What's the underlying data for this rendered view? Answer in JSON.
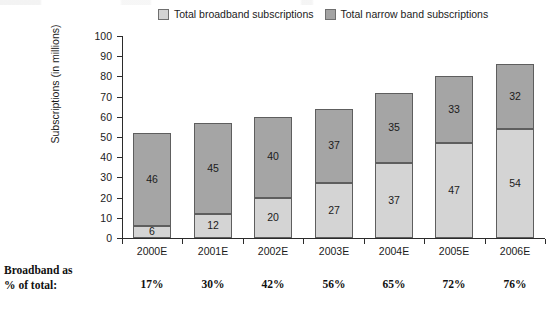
{
  "legend": {
    "entries": [
      {
        "label": "Total broadband subscriptions",
        "swatch_icon": "square-swatch-light",
        "color": "#d4d4d4"
      },
      {
        "label": "Total narrow band subscriptions",
        "swatch_icon": "square-swatch-dark",
        "color": "#a5a5a5"
      }
    ]
  },
  "footer": {
    "label": "Broadband as\n% of total:",
    "values": [
      "17%",
      "30%",
      "42%",
      "56%",
      "65%",
      "72%",
      "76%"
    ]
  },
  "chart_data": {
    "type": "bar",
    "stacked": true,
    "title": "",
    "xlabel": "",
    "ylabel": "Subscriptions (in millions)",
    "ylim": [
      0,
      100
    ],
    "yticks": [
      0,
      10,
      20,
      30,
      40,
      50,
      60,
      70,
      80,
      90,
      100
    ],
    "ytick_labels": [
      "0",
      "10",
      "20",
      "30",
      "40",
      "50",
      "60",
      "70",
      "80",
      "90",
      "100"
    ],
    "grid": false,
    "legend_position": "top-center",
    "categories": [
      "2000E",
      "2001E",
      "2002E",
      "2003E",
      "2004E",
      "2005E",
      "2006E"
    ],
    "series": [
      {
        "name": "Total broadband subscriptions",
        "color": "#d4d4d4",
        "values": [
          6,
          12,
          20,
          27,
          37,
          47,
          54
        ],
        "data_labels": [
          "6",
          "12",
          "20",
          "27",
          "37",
          "47",
          "54"
        ]
      },
      {
        "name": "Total narrow band subscriptions",
        "color": "#a5a5a5",
        "values": [
          46,
          45,
          40,
          37,
          35,
          33,
          32
        ],
        "data_labels": [
          "46",
          "45",
          "40",
          "37",
          "35",
          "33",
          "32"
        ]
      }
    ],
    "totals": [
      52,
      57,
      60,
      64,
      72,
      80,
      86
    ],
    "annotations": {
      "broadband_share_of_total": [
        "17%",
        "30%",
        "42%",
        "56%",
        "65%",
        "72%",
        "76%"
      ]
    }
  }
}
